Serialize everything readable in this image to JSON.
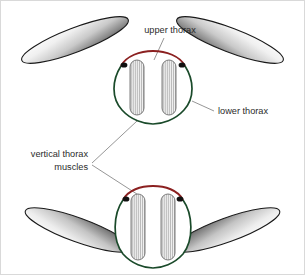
{
  "figure": {
    "background_color": "#ffffff",
    "frame_color": "#d9d9d9"
  },
  "colors": {
    "upper_thorax_red": "#8B2020",
    "lower_thorax_green": "#1a4a2a",
    "muscle_gray_light": "#f4f4f4",
    "muscle_gray_mid": "#b9b9b9",
    "muscle_outline": "#6f6f6f",
    "wing_outline": "#1a1a1a",
    "wing_light": "#fdfdfd",
    "wing_dark": "#4a4a4a",
    "hinge_black": "#111111",
    "leader_line": "#8a8a8a",
    "label_text": "#2b2b2b"
  },
  "labels": [
    {
      "id": "upper-thorax",
      "text": "upper thorax",
      "x": 170,
      "y": 33,
      "anchor": "middle",
      "icon": "text-label"
    },
    {
      "id": "lower-thorax",
      "text": "lower thorax",
      "x": 218,
      "y": 114,
      "anchor": "start",
      "icon": "text-label"
    },
    {
      "id": "vertical-thorax-muscles",
      "line1": "vertical thorax",
      "line2": "muscles",
      "x": 88,
      "y1": 157,
      "y2": 170,
      "anchor": "end",
      "icon": "text-label"
    }
  ],
  "diagrams": [
    {
      "id": "wings-up",
      "caption_role": "upstroke",
      "wing_position": "raised",
      "body_shape": "rounded-compressed",
      "muscle_state": "contracted-short"
    },
    {
      "id": "wings-down",
      "caption_role": "downstroke",
      "wing_position": "lowered",
      "body_shape": "tall-elongated",
      "muscle_state": "relaxed-long"
    }
  ],
  "anatomy_parts": [
    "upper thorax",
    "lower thorax",
    "vertical thorax muscles",
    "wing",
    "wing hinge"
  ]
}
